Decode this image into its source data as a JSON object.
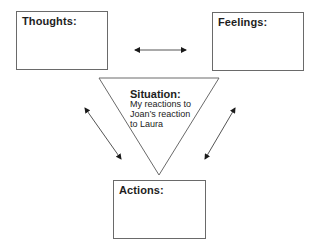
{
  "diagram": {
    "boxes": {
      "thoughts": {
        "label": "Thoughts:"
      },
      "feelings": {
        "label": "Feelings:"
      },
      "actions": {
        "label": "Actions:"
      }
    },
    "situation": {
      "title": "Situation:",
      "lines": [
        "My reactions to",
        "Joan’s reaction",
        "to Laura"
      ]
    },
    "arrows": [
      {
        "from": "thoughts",
        "to": "feelings",
        "type": "bidirectional"
      },
      {
        "from": "thoughts",
        "to": "actions",
        "type": "bidirectional"
      },
      {
        "from": "feelings",
        "to": "actions",
        "type": "bidirectional"
      }
    ],
    "colors": {
      "line": "#6a6a6a",
      "arrow": "#555555",
      "arrowhead": "#1a1a1a",
      "text": "#1e1e1e"
    }
  }
}
